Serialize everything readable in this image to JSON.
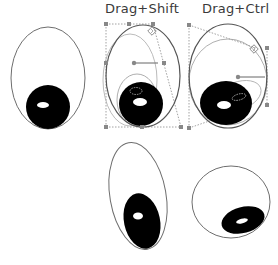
{
  "labels": {
    "shift": "Drag+Shift",
    "ctrl": "Drag+Ctrl"
  },
  "colors": {
    "outline": "#6e6e6e",
    "pupil": "#000000",
    "highlight": "#ffffff",
    "guide": "#8a8a8a",
    "handle": "#7a7a7a"
  },
  "panels": [
    {
      "id": "original",
      "caption": ""
    },
    {
      "id": "drag-shift",
      "caption": "Drag+Shift"
    },
    {
      "id": "drag-ctrl",
      "caption": "Drag+Ctrl"
    },
    {
      "id": "result-shift",
      "caption": ""
    },
    {
      "id": "result-ctrl",
      "caption": ""
    }
  ]
}
